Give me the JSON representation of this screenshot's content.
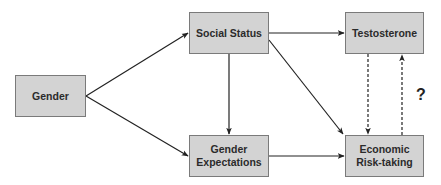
{
  "diagram": {
    "type": "causal-path-diagram",
    "nodes": [
      {
        "id": "gender",
        "label": "Gender"
      },
      {
        "id": "social_status",
        "label": "Social Status"
      },
      {
        "id": "gender_expectations",
        "label": "Gender Expectations",
        "lines": [
          "Gender",
          "Expectations"
        ]
      },
      {
        "id": "testosterone",
        "label": "Testosterone"
      },
      {
        "id": "economic_risk",
        "label": "Economic Risk-taking",
        "lines": [
          "Economic",
          "Risk-taking"
        ]
      }
    ],
    "edges": [
      {
        "from": "gender",
        "to": "social_status",
        "style": "solid"
      },
      {
        "from": "gender",
        "to": "gender_expectations",
        "style": "solid"
      },
      {
        "from": "social_status",
        "to": "gender_expectations",
        "style": "solid"
      },
      {
        "from": "social_status",
        "to": "testosterone",
        "style": "solid"
      },
      {
        "from": "social_status",
        "to": "economic_risk",
        "style": "solid"
      },
      {
        "from": "gender_expectations",
        "to": "economic_risk",
        "style": "solid"
      },
      {
        "from": "testosterone",
        "to": "economic_risk",
        "style": "dashed"
      },
      {
        "from": "economic_risk",
        "to": "testosterone",
        "style": "dashed"
      }
    ],
    "annotation": "?",
    "colors": {
      "node_fill": "#d3d3d3",
      "node_border": "#7a7a7a",
      "text": "#2b2b2b",
      "edge": "#222222"
    }
  }
}
